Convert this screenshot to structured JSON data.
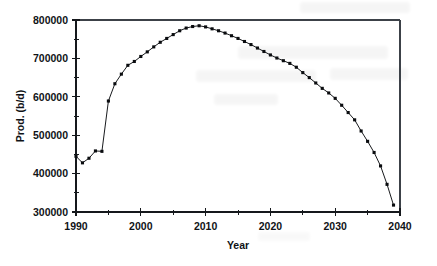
{
  "chart_data": {
    "type": "line",
    "title": "",
    "subtitle": "",
    "xlabel": "Year",
    "ylabel": "Prod. (b/d)",
    "xlim": [
      1990,
      2040
    ],
    "ylim": [
      300000,
      800000
    ],
    "x_major_ticks": [
      1990,
      2000,
      2010,
      2020,
      2030,
      2040
    ],
    "x_minor_ticks": [
      1995,
      2005,
      2015,
      2025,
      2035
    ],
    "x_tick_labels": [
      "1990",
      "2000",
      "2010",
      "2020",
      "2030",
      "2040"
    ],
    "y_major_ticks": [
      300000,
      400000,
      500000,
      600000,
      700000,
      800000
    ],
    "y_minor_ticks": [
      350000,
      450000,
      550000,
      650000,
      750000
    ],
    "y_tick_labels": [
      "300000",
      "400000",
      "500000",
      "600000",
      "700000",
      "800000"
    ],
    "grid": false,
    "legend": null,
    "legend_position": "none",
    "marker": "filled-square",
    "line_color": "#0c0e11",
    "marker_color": "#0a0c0f",
    "series": [
      {
        "name": "Production",
        "x": [
          1990,
          1991,
          1992,
          1993,
          1994,
          1995,
          1996,
          1997,
          1998,
          1999,
          2000,
          2001,
          2002,
          2003,
          2004,
          2005,
          2006,
          2007,
          2008,
          2009,
          2010,
          2011,
          2012,
          2013,
          2014,
          2015,
          2016,
          2017,
          2018,
          2019,
          2020,
          2021,
          2022,
          2023,
          2024,
          2025,
          2026,
          2027,
          2028,
          2029,
          2030,
          2031,
          2032,
          2033,
          2034,
          2035,
          2036,
          2037,
          2038,
          2039
        ],
        "values": [
          445000,
          428000,
          440000,
          459000,
          458000,
          589000,
          634000,
          659000,
          682000,
          692000,
          705000,
          717000,
          730000,
          742000,
          752000,
          762000,
          772000,
          779000,
          783000,
          785000,
          782000,
          777000,
          772000,
          766000,
          759000,
          752000,
          744000,
          736000,
          727000,
          718000,
          709000,
          701000,
          694000,
          687000,
          677000,
          663000,
          650000,
          636000,
          622000,
          610000,
          596000,
          578000,
          559000,
          540000,
          511000,
          484000,
          455000,
          420000,
          372000,
          318000
        ]
      }
    ]
  },
  "plot_geometry": {
    "left": 76,
    "right": 400,
    "top": 20,
    "bottom": 212
  }
}
